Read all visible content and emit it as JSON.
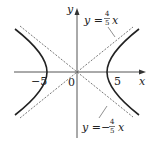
{
  "diagram": {
    "type": "hyperbola",
    "axes": {
      "x_label": "x",
      "y_label": "y",
      "origin_label": "0",
      "tick_labels": [
        "−5",
        "5"
      ]
    },
    "asymptotes": [
      {
        "lhs": "y =",
        "sign": "",
        "num": "4",
        "den": "5",
        "var": "x",
        "style": "dashed"
      },
      {
        "lhs": "y =",
        "sign": "−",
        "num": "4",
        "den": "5",
        "var": "x",
        "style": "dashed"
      }
    ],
    "curve": {
      "vertices": [
        -5,
        5
      ],
      "slope": 0.8,
      "style": "solid"
    }
  }
}
